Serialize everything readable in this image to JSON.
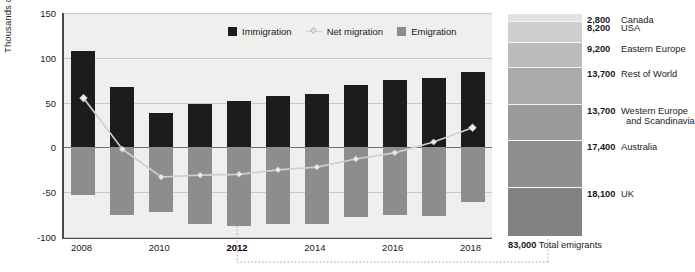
{
  "chart_data": {
    "type": "bar",
    "title": "",
    "subtitle": "",
    "ylabel": "Thousands of persons",
    "xlabel": "",
    "ylim": [
      -100,
      150
    ],
    "yticks": [
      150,
      100,
      50,
      0,
      -50,
      -100
    ],
    "grid": true,
    "legend_position": "top-right",
    "categories": [
      "2008",
      "2009",
      "2010",
      "2011",
      "2012",
      "2013",
      "2014",
      "2015",
      "2016",
      "2017",
      "2018"
    ],
    "xtick_labels": [
      "2008",
      "2010",
      "2012",
      "2014",
      "2016",
      "2018"
    ],
    "highlighted_category": "2012",
    "series": [
      {
        "name": "Immigration",
        "type": "bar",
        "color": "#1c1c1c",
        "values": [
          108,
          68,
          38,
          48,
          52,
          57,
          60,
          70,
          75,
          77,
          84
        ]
      },
      {
        "name": "Emigration",
        "type": "bar",
        "color": "#8d8d8d",
        "values": [
          -53,
          -76,
          -72,
          -85,
          -88,
          -85,
          -85,
          -78,
          -76,
          -77,
          -61
        ]
      },
      {
        "name": "Net migration",
        "type": "line",
        "color": "#cfcfcf",
        "values": [
          55,
          -2,
          -33,
          -31,
          -30,
          -25,
          -22,
          -13,
          -6,
          6,
          22
        ]
      }
    ]
  },
  "legend": {
    "items": [
      {
        "label": "Immigration",
        "marker": "square-dark"
      },
      {
        "label": "Net migration",
        "marker": "line-diamond"
      },
      {
        "label": "Emigration",
        "marker": "square-gray"
      }
    ]
  },
  "axis": {
    "ylabel": "Thousands of persons",
    "yticks": [
      "150",
      "100",
      "50",
      "0",
      "-50",
      "-100"
    ]
  },
  "breakdown": {
    "title": "",
    "segments": [
      {
        "value": "2,800",
        "name": "Canada",
        "name2": "",
        "color": "#e2e2e0",
        "share": 2800
      },
      {
        "value": "8,200",
        "name": "USA",
        "name2": "",
        "color": "#cfcfcd",
        "share": 8200
      },
      {
        "value": "9,200",
        "name": "Eastern Europe",
        "name2": "",
        "color": "#bcbcba",
        "share": 9200
      },
      {
        "value": "13,700",
        "name": "Rest of World",
        "name2": "",
        "color": "#aaaaa8",
        "share": 13700
      },
      {
        "value": "13,700",
        "name": "Western Europe",
        "name2": "and Scandinavia",
        "color": "#9b9b99",
        "share": 13700
      },
      {
        "value": "17,400",
        "name": "Australia",
        "name2": "",
        "color": "#8e8e8c",
        "share": 17400
      },
      {
        "value": "18,100",
        "name": "UK",
        "name2": "",
        "color": "#828280",
        "share": 18100
      }
    ],
    "total": {
      "value": "83,000",
      "label": "Total emigrants"
    }
  },
  "colors": {
    "immigration": "#1c1c1c",
    "emigration": "#8d8d8d",
    "net_migration": "#cfcfcf",
    "plot_background": "#efefed",
    "axis": "#4a4a4a",
    "gridline": "#c9c9c5"
  }
}
